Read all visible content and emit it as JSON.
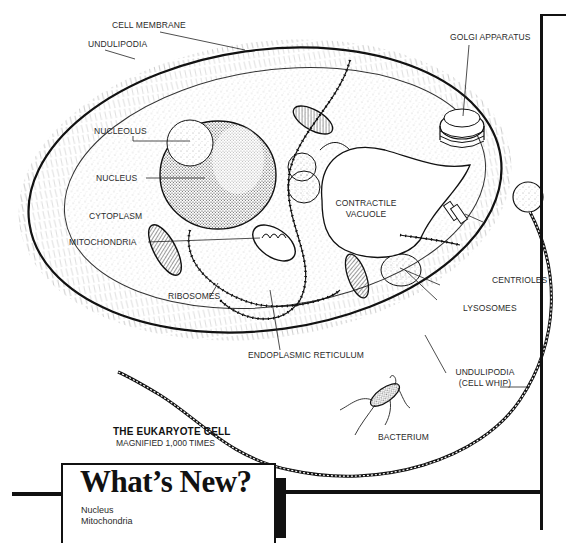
{
  "diagram": {
    "title": "THE EUKARYOTE CELL",
    "subtitle": "MAGNIFIED 1,000 TIMES",
    "labels": {
      "cell_membrane": "CELL MEMBRANE",
      "undulipodia_top": "UNDULIPODIA",
      "golgi_apparatus": "GOLGI APPARATUS",
      "nucleolus": "NUCLEOLUS",
      "nucleus": "NUCLEUS",
      "cytoplasm": "CYTOPLASM",
      "contractile_vacuole_line1": "CONTRACTILE",
      "contractile_vacuole_line2": "VACUOLE",
      "mitochondria": "MITOCHONDRIA",
      "ribosomes": "RIBOSOMES",
      "centrioles": "CENTRIOLES",
      "lysosomes": "LYSOSOMES",
      "endoplasmic_reticulum": "ENDOPLASMIC RETICULUM",
      "undulipodia_whip_line1": "UNDULIPODIA",
      "undulipodia_whip_line2": "(CELL WHIP)",
      "bacterium": "BACTERIUM"
    },
    "colors": {
      "ink": "#1a1a1a",
      "paper": "#ffffff"
    }
  },
  "whats_new": {
    "title": "What’s New?",
    "items": [
      "Nucleus",
      "Mitochondria"
    ]
  }
}
